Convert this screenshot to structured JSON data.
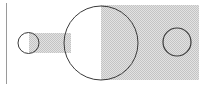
{
  "diagram": {
    "colors": {
      "background": "#ffffff",
      "stroke": "#3a3a3a",
      "baseline": "#9a9a9a",
      "shade_light": "#e2e2e2",
      "shade_dark": "#c4c4c4"
    },
    "baseline": {
      "x": 6.5,
      "y1": 3,
      "y2": 84
    },
    "shaded_rect": {
      "x": 101,
      "y": 5,
      "width": 98,
      "height": 75
    },
    "connector_band": {
      "x": 29,
      "y": 33,
      "width": 42,
      "height": 20
    },
    "small_circle": {
      "cx": 28.5,
      "cy": 43,
      "r": 10.5
    },
    "large_circle": {
      "cx": 101,
      "cy": 43,
      "r": 37
    },
    "inner_circle": {
      "cx": 177,
      "cy": 42,
      "r": 14
    }
  }
}
